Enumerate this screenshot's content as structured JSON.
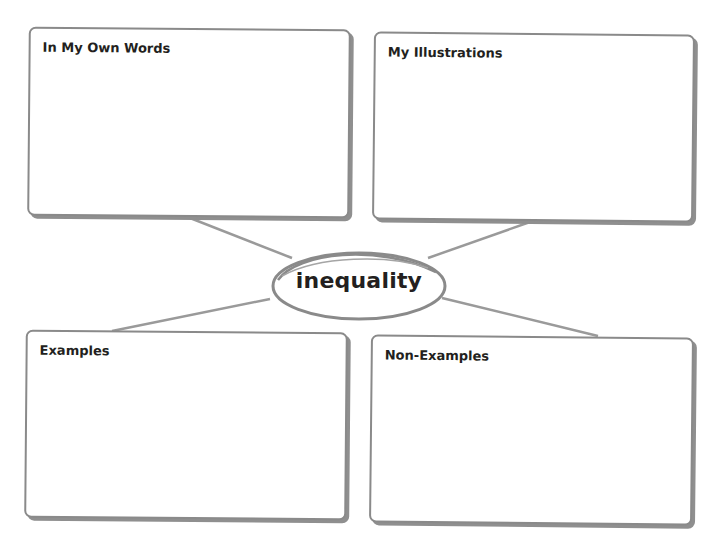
{
  "organizer": {
    "type": "vocabulary-word-map",
    "term": "inequality",
    "boxes": {
      "top_left": {
        "label": "In My Own Words"
      },
      "top_right": {
        "label": "My Illustrations"
      },
      "bottom_left": {
        "label": "Examples"
      },
      "bottom_right": {
        "label": "Non-Examples"
      }
    }
  },
  "colors": {
    "border": "#8a8a8a",
    "shadow": "#8f8f8f",
    "connector": "#999999",
    "text": "#231f20",
    "background": "#ffffff"
  }
}
